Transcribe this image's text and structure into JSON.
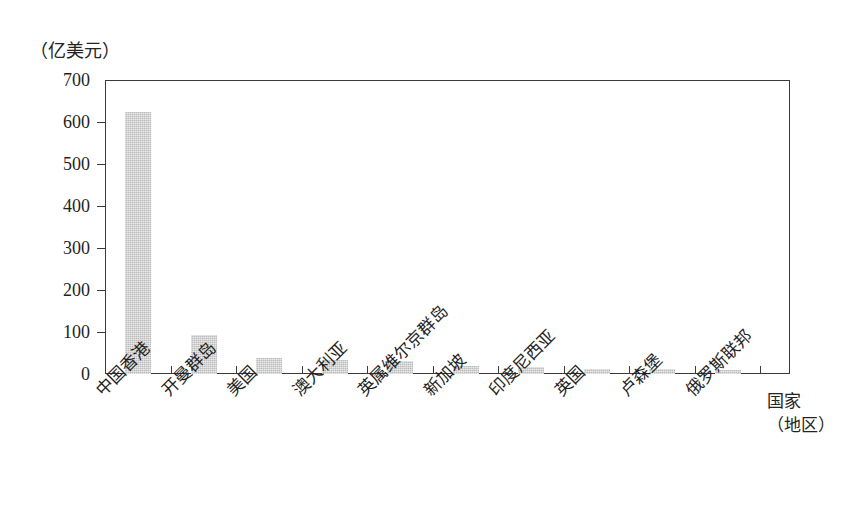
{
  "chart_data": {
    "type": "bar",
    "title": "",
    "subtitle": "",
    "xlabel": "国家（地区）",
    "xlabel_line1": "国家",
    "xlabel_line2": "（地区）",
    "ylabel": "（亿美元）",
    "ylim": [
      0,
      700
    ],
    "ytick_step": 100,
    "yticks": [
      700,
      600,
      500,
      400,
      300,
      200,
      100,
      0
    ],
    "ytick_labels": [
      "700",
      "600",
      "500",
      "400",
      "300",
      "200",
      "100",
      "0"
    ],
    "grid": false,
    "legend": false,
    "legend_position": "none",
    "bar_color": "#bcbcbc",
    "axis_color": "#3a3a3a",
    "categories": [
      "中国香港",
      "开曼群岛",
      "美国",
      "澳大利亚",
      "英属维尔京群岛",
      "新加坡",
      "印度尼西亚",
      "英国",
      "卢森堡",
      "俄罗斯联邦"
    ],
    "values": [
      625,
      92,
      38,
      34,
      31,
      20,
      16,
      13,
      11,
      10
    ]
  }
}
